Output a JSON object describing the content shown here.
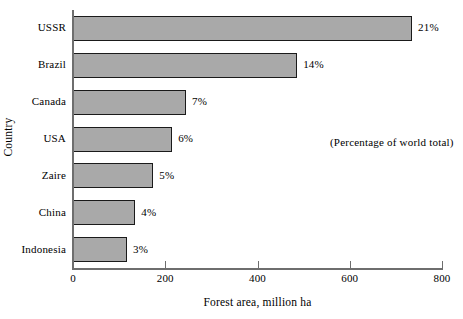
{
  "chart_data": {
    "type": "bar",
    "orientation": "horizontal",
    "title": "",
    "xlabel": "Forest area, million ha",
    "ylabel": "Country",
    "categories": [
      "USSR",
      "Brazil",
      "Canada",
      "USA",
      "Zaire",
      "China",
      "Indonesia"
    ],
    "values": [
      735,
      486,
      245,
      215,
      174,
      135,
      117
    ],
    "data_labels": [
      "21%",
      "14%",
      "7%",
      "6%",
      "5%",
      "4%",
      "3%"
    ],
    "xlim": [
      0,
      800
    ],
    "xticks": [
      0,
      200,
      400,
      600,
      800
    ],
    "xtick_labels": [
      "0",
      "200",
      "400",
      "600",
      "800"
    ],
    "grid": false,
    "legend": false,
    "annotation": "(Percentage of world total)",
    "bar_fill_color": "#a9a9a9",
    "bar_edge_color": "#1a1a1a",
    "axis_color": "#6e6e6e",
    "background_color": "#ffffff"
  }
}
